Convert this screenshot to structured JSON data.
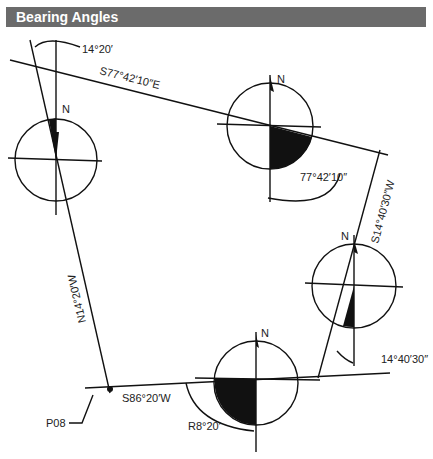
{
  "header": {
    "title": "Bearing Angles"
  },
  "labels": {
    "top_angle": "14°20′",
    "line_top": "S77°42′10″E",
    "angle_right_top": "77°42′10″",
    "line_right": "S14°40′30″W",
    "angle_right_bottom": "14°40′30″",
    "line_left": "N14°20′W",
    "line_bottom": "S86°20′W",
    "angle_bottom": "R8°20′",
    "point": "P08",
    "north": "N"
  },
  "colors": {
    "header_bg": "#6b6b6b",
    "header_text": "#ffffff",
    "ink": "#111111"
  }
}
